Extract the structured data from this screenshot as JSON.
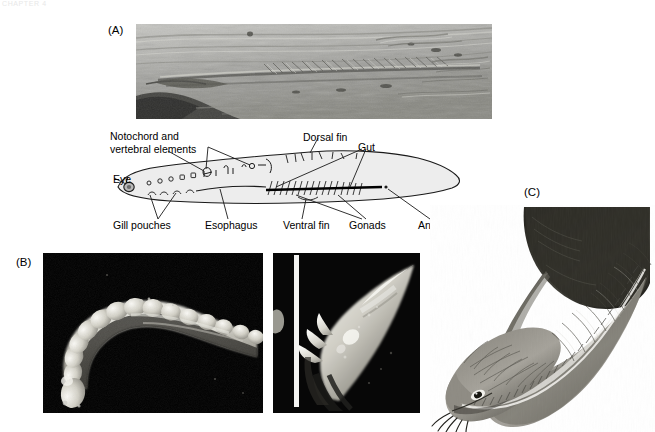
{
  "figure": {
    "ghost_header": "CHAPTER 4",
    "panels": {
      "a_letter": "(A)",
      "b_letter": "(B)",
      "c_letter": "(C)"
    }
  },
  "diagram_labels": {
    "notochord_line1": "Notochord and",
    "notochord_line2": "vertebral elements",
    "dorsal_fin": "Dorsal fin",
    "gut": "Gut",
    "eye": "Eye",
    "gill_pouches": "Gill pouches",
    "esophagus": "Esophagus",
    "ventral_fin": "Ventral fin",
    "gonads": "Gonads",
    "anus": "Anus (?)"
  },
  "colors": {
    "background": "#ffffff",
    "text": "#000000",
    "photo_frame": "#000000",
    "fossil_rock_mid": "#9b9b98",
    "fossil_rock_light": "#c9c9c5",
    "fossil_rock_dark": "#4a4a47",
    "diagram_body_fill": "#ededed",
    "diagram_stroke": "#1a1a1a",
    "ghost_header": "#e8e8e8",
    "reconstruction_dark": "#2a2a28",
    "reconstruction_mid": "#6e6d68",
    "reconstruction_light": "#b9b6ad"
  },
  "photo_captions": {
    "panel_a_subject": "fossil-specimen-slab",
    "panel_b_left_subject": "conodont-element-sem-curved",
    "panel_b_right_subject": "conodont-element-sem-conical",
    "panel_c_subject": "conodont-animal-life-reconstruction"
  }
}
